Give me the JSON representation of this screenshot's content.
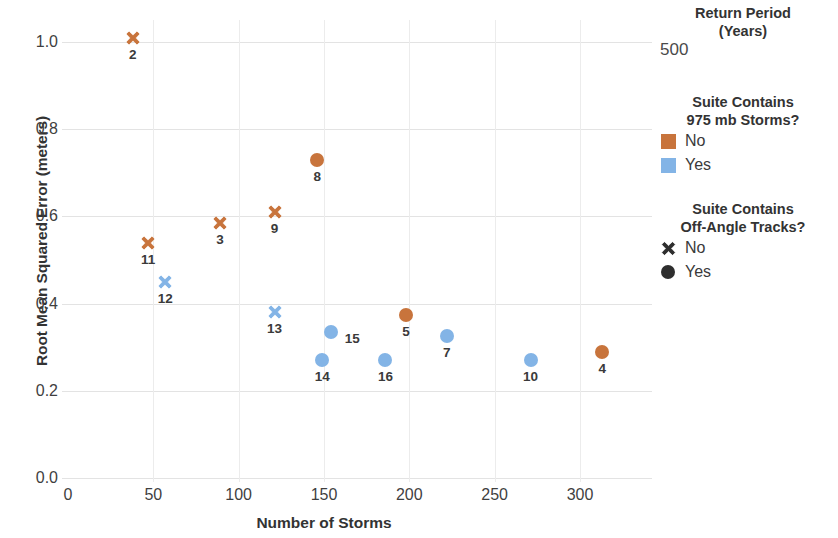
{
  "chart_data": {
    "type": "scatter",
    "title": "",
    "xlabel": "Number of Storms",
    "ylabel": "Root Mean Squared Error (meters)",
    "xlim": [
      0,
      320
    ],
    "ylim": [
      0,
      1.08
    ],
    "xticks": [
      0,
      50,
      100,
      150,
      200,
      250,
      300
    ],
    "xtick_labels": [
      "0",
      "50",
      "100",
      "150",
      "200",
      "250",
      "300"
    ],
    "yticks": [
      0.0,
      0.2,
      0.4,
      0.6,
      0.8,
      1.0
    ],
    "ytick_labels": [
      "0.0",
      "0.2",
      "0.4",
      "0.6",
      "0.8",
      "1.0"
    ],
    "grid": true,
    "legend_position": "right",
    "colors": {
      "no_975mb": "#c8743c",
      "yes_975mb": "#83b4e6",
      "marker_outline_legend": "#3a3a3a"
    },
    "points": [
      {
        "label": "2",
        "x": 38,
        "y": 1.01,
        "marker": "x",
        "color_group": "No",
        "color": "#c8743c",
        "label_pos": "below"
      },
      {
        "label": "11",
        "x": 47,
        "y": 0.54,
        "marker": "x",
        "color_group": "No",
        "color": "#c8743c",
        "label_pos": "below"
      },
      {
        "label": "12",
        "x": 57,
        "y": 0.45,
        "marker": "x",
        "color_group": "Yes",
        "color": "#83b4e6",
        "label_pos": "below"
      },
      {
        "label": "3",
        "x": 89,
        "y": 0.585,
        "marker": "x",
        "color_group": "No",
        "color": "#c8743c",
        "label_pos": "below"
      },
      {
        "label": "9",
        "x": 121,
        "y": 0.61,
        "marker": "x",
        "color_group": "No",
        "color": "#c8743c",
        "label_pos": "below"
      },
      {
        "label": "13",
        "x": 121,
        "y": 0.38,
        "marker": "x",
        "color_group": "Yes",
        "color": "#83b4e6",
        "label_pos": "below"
      },
      {
        "label": "8",
        "x": 146,
        "y": 0.73,
        "marker": "circle",
        "color_group": "No",
        "color": "#c8743c",
        "label_pos": "below"
      },
      {
        "label": "15",
        "x": 154,
        "y": 0.335,
        "marker": "circle",
        "color_group": "Yes",
        "color": "#83b4e6",
        "label_pos": "right"
      },
      {
        "label": "14",
        "x": 149,
        "y": 0.27,
        "marker": "circle",
        "color_group": "Yes",
        "color": "#83b4e6",
        "label_pos": "below"
      },
      {
        "label": "16",
        "x": 186,
        "y": 0.27,
        "marker": "circle",
        "color_group": "Yes",
        "color": "#83b4e6",
        "label_pos": "below"
      },
      {
        "label": "5",
        "x": 198,
        "y": 0.375,
        "marker": "circle",
        "color_group": "No",
        "color": "#c8743c",
        "label_pos": "below"
      },
      {
        "label": "7",
        "x": 222,
        "y": 0.325,
        "marker": "circle",
        "color_group": "Yes",
        "color": "#83b4e6",
        "label_pos": "below"
      },
      {
        "label": "10",
        "x": 271,
        "y": 0.27,
        "marker": "circle",
        "color_group": "Yes",
        "color": "#83b4e6",
        "label_pos": "below"
      },
      {
        "label": "4",
        "x": 313,
        "y": 0.29,
        "marker": "circle",
        "color_group": "No",
        "color": "#c8743c",
        "label_pos": "below"
      }
    ]
  },
  "legend": {
    "return_period": {
      "title_line1": "Return Period",
      "title_line2": "(Years)",
      "value": "500"
    },
    "storms_975mb": {
      "title_line1": "Suite Contains",
      "title_line2": "975 mb Storms?",
      "entries": [
        {
          "label": "No",
          "swatch": "square-orange",
          "color": "#c8743c"
        },
        {
          "label": "Yes",
          "swatch": "square-blue",
          "color": "#83b4e6"
        }
      ]
    },
    "off_angle_tracks": {
      "title_line1": "Suite Contains",
      "title_line2": "Off-Angle Tracks?",
      "entries": [
        {
          "label": "No",
          "swatch": "x-marker-icon",
          "color": "#2e2e2e"
        },
        {
          "label": "Yes",
          "swatch": "circle-marker-icon",
          "color": "#2e2e2e"
        }
      ]
    }
  }
}
